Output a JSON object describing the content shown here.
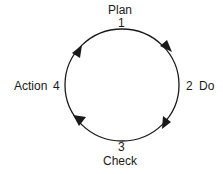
{
  "diagram": {
    "type": "cycle",
    "direction": "clockwise",
    "stages": [
      {
        "number": "1",
        "label": "Plan"
      },
      {
        "number": "2",
        "label": "Do"
      },
      {
        "number": "3",
        "label": "Check"
      },
      {
        "number": "4",
        "label": "Action"
      }
    ],
    "colors": {
      "stroke": "#1a1a1a",
      "background": "#ffffff"
    }
  }
}
